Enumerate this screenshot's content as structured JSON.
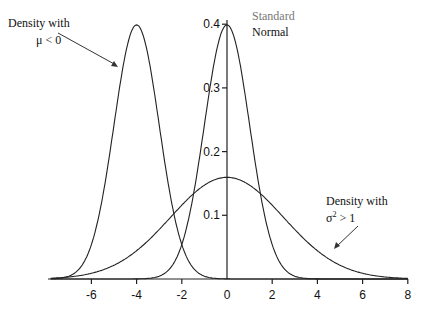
{
  "chart_data": {
    "type": "line",
    "title": "",
    "xlabel": "",
    "ylabel": "",
    "xlim": [
      -7.8,
      8
    ],
    "ylim": [
      0,
      0.4
    ],
    "grid": false,
    "legend": null,
    "x_ticks": [
      -6,
      -4,
      -2,
      0,
      2,
      4,
      6,
      8
    ],
    "x_tick_labels": [
      "-6",
      "-4",
      "-2",
      "0",
      "2",
      "4",
      "6",
      "8"
    ],
    "y_ticks": [
      0.1,
      0.2,
      0.3,
      0.4
    ],
    "y_tick_labels": [
      "0.1",
      "0.2",
      "0.3",
      "0.4"
    ],
    "series": [
      {
        "name": "Density with μ < 0",
        "distribution": "normal",
        "mean": -4,
        "sd": 1,
        "peak": 0.399
      },
      {
        "name": "Standard Normal",
        "distribution": "normal",
        "mean": 0,
        "sd": 1,
        "peak": 0.399
      },
      {
        "name": "Density with σ² > 1",
        "distribution": "normal",
        "mean": 0,
        "sd": 2.5,
        "peak": 0.16
      }
    ],
    "annotations": [
      {
        "text": [
          "Density with",
          "μ < 0"
        ],
        "points_to": "curve mean -4"
      },
      {
        "text": [
          "Standard",
          "Normal"
        ],
        "points_to": "peak of standard normal"
      },
      {
        "text": [
          "Density with",
          "σ² > 1"
        ],
        "points_to": "right tail of wide curve"
      }
    ]
  },
  "labels": {
    "neg_mean_line1": "Density with",
    "neg_mean_line2": "μ < 0",
    "std_line1": "Standard",
    "std_line2": "Normal",
    "wide_line1": "Density with",
    "wide_line2_base": "σ",
    "wide_line2_sup": "2",
    "wide_line2_rest": " > 1"
  },
  "axis": {
    "x_labels": [
      "-6",
      "-4",
      "-2",
      "0",
      "2",
      "4",
      "6",
      "8"
    ],
    "y_labels": [
      "0.1",
      "0.2",
      "0.3",
      "0.4"
    ]
  }
}
